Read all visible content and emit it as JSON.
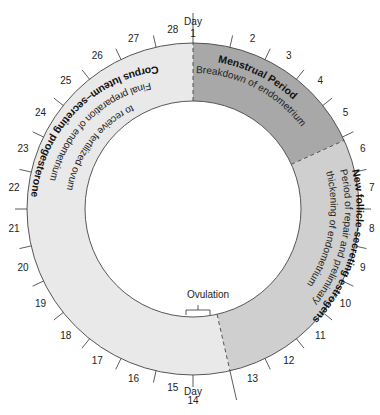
{
  "diagram": {
    "type": "menstrual-cycle-ring",
    "total_days": 28,
    "day_label": "Day",
    "day_numbers": [
      "1",
      "2",
      "3",
      "4",
      "5",
      "6",
      "7",
      "8",
      "9",
      "10",
      "11",
      "12",
      "13",
      "14",
      "15",
      "16",
      "17",
      "18",
      "19",
      "20",
      "21",
      "22",
      "23",
      "24",
      "25",
      "26",
      "27",
      "28"
    ],
    "phases": [
      {
        "title": "Menstrual Period",
        "description": "Breakdown of endometrium",
        "start_day": 1,
        "end_day": 5,
        "color": "#a8a8a8"
      },
      {
        "title": "New follicle-secreting estrogens",
        "description_line1": "Period of repair and preliminary",
        "description_line2": "thickening of endometrium",
        "start_day": 6,
        "end_day": 14,
        "color": "#cfcfcf"
      },
      {
        "title": "Corpus luteum–secreting progesterone",
        "description_line1": "Final preparation of endometrium",
        "description_line2": "to receive fertilized ovum",
        "start_day": 14,
        "end_day": 28,
        "color": "#e9e9e9"
      }
    ],
    "ovulation_label": "Ovulation",
    "day1_label": "Day 1",
    "day14_label": "Day 14"
  }
}
